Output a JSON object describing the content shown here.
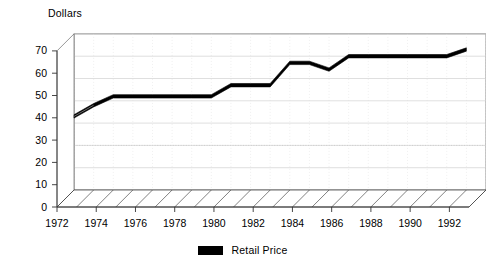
{
  "chart_data": {
    "type": "line",
    "title": "",
    "ylabel": "Dollars",
    "xlabel": "",
    "ylim": [
      0,
      70
    ],
    "ytick_labels": [
      "0",
      "10",
      "20",
      "30",
      "40",
      "50",
      "60",
      "70"
    ],
    "yticks": [
      0,
      10,
      20,
      30,
      40,
      50,
      60,
      70
    ],
    "xlim": [
      1972,
      1993
    ],
    "xtick_labels": [
      "1972",
      "1974",
      "1976",
      "1978",
      "1980",
      "1982",
      "1984",
      "1986",
      "1988",
      "1990",
      "1992"
    ],
    "xticks": [
      1972,
      1974,
      1976,
      1978,
      1980,
      1982,
      1984,
      1986,
      1988,
      1990,
      1992
    ],
    "grid": true,
    "legend_position": "bottom",
    "style": "3d-perspective",
    "series": [
      {
        "name": "Retail Price",
        "color": "#000000",
        "x": [
          1972,
          1973,
          1974,
          1975,
          1976,
          1977,
          1978,
          1979,
          1980,
          1981,
          1982,
          1983,
          1984,
          1985,
          1986,
          1987,
          1988,
          1989,
          1990,
          1991,
          1992
        ],
        "values": [
          33,
          38,
          42,
          42,
          42,
          42,
          42,
          42,
          47,
          47,
          47,
          57,
          57,
          54,
          60,
          60,
          60,
          60,
          60,
          60,
          63
        ]
      }
    ]
  },
  "legend": {
    "entries": [
      {
        "label": "Retail Price",
        "color": "#000000"
      }
    ]
  }
}
